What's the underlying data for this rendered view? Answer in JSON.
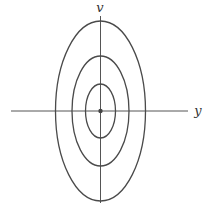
{
  "diagram": {
    "type": "contour-ellipses",
    "axes": {
      "horizontal": {
        "label": "y"
      },
      "vertical": {
        "label": "v"
      }
    },
    "center": {
      "x": 100.5,
      "y": 111
    },
    "ellipses": [
      {
        "name": "inner",
        "rx": 15,
        "ry": 27
      },
      {
        "name": "middle",
        "rx": 28.5,
        "ry": 55
      },
      {
        "name": "outer",
        "rx": 45,
        "ry": 90
      }
    ],
    "center_marker": "dot",
    "colors": {
      "stroke": "#4a4a4a",
      "background": "#ffffff"
    }
  }
}
